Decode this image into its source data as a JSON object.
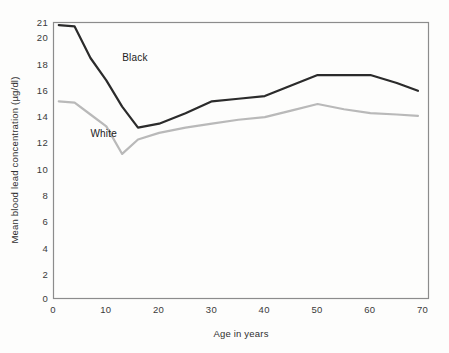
{
  "chart_data": {
    "type": "line",
    "title": "",
    "xlabel": "Age in years",
    "ylabel": "Mean blood lead concentration (µg/dl)",
    "xlim": [
      0,
      71
    ],
    "ylim": [
      0,
      21
    ],
    "xticks": [
      "0",
      "10",
      "20",
      "30",
      "40",
      "50",
      "60",
      "70"
    ],
    "xtick_values": [
      0,
      10,
      20,
      30,
      40,
      50,
      60,
      70
    ],
    "yticks": [
      "0",
      "2",
      "4",
      "6",
      "8",
      "10",
      "12",
      "14",
      "16",
      "18",
      "20",
      "21"
    ],
    "ytick_values": [
      0,
      2,
      4,
      6,
      8,
      10,
      12,
      14,
      16,
      18,
      20,
      21
    ],
    "grid": false,
    "legend_position": "inline-annotation",
    "frame": "box",
    "series": [
      {
        "name": "Black",
        "color": "#2b2b2b",
        "label_text": "Black",
        "label_x": 13,
        "label_y": 18.05,
        "x": [
          1,
          4,
          7,
          10,
          13,
          16,
          20,
          25,
          30,
          35,
          40,
          45,
          50,
          55,
          60,
          65,
          69
        ],
        "y": [
          20.8,
          20.7,
          18.3,
          16.6,
          14.6,
          13.0,
          13.3,
          14.1,
          15.0,
          15.2,
          15.4,
          16.2,
          17.0,
          17.0,
          17.0,
          16.4,
          15.8
        ]
      },
      {
        "name": "White",
        "color": "#b9b9b9",
        "label_text": "White",
        "label_x": 7,
        "label_y": 12.3,
        "x": [
          1,
          4,
          7,
          10,
          13,
          16,
          20,
          25,
          30,
          35,
          40,
          45,
          50,
          55,
          60,
          65,
          69
        ],
        "y": [
          15.0,
          14.9,
          14.0,
          13.1,
          11.0,
          12.1,
          12.6,
          13.0,
          13.3,
          13.6,
          13.8,
          14.3,
          14.8,
          14.4,
          14.1,
          14.0,
          13.9
        ]
      }
    ]
  },
  "axes": {
    "x_axis_label": "Age in years",
    "y_axis_label": "Mean blood lead concentration (µg/dl)"
  },
  "colors": {
    "black_series": "#2b2b2b",
    "white_series": "#b9b9b9",
    "frame": "#8c8c8c",
    "background": "#fdfdfc"
  }
}
